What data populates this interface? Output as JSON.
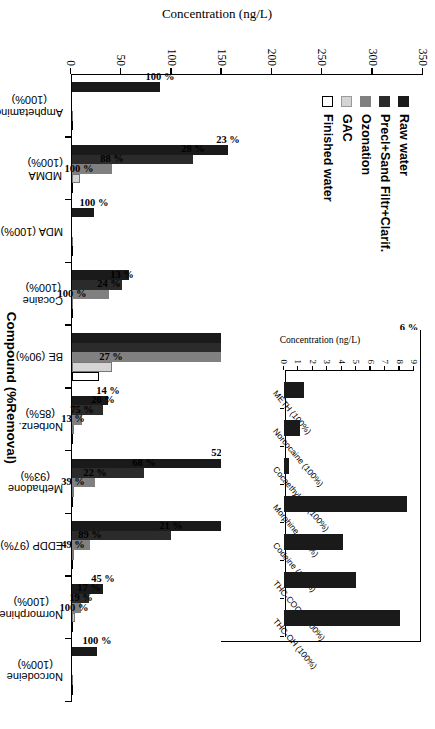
{
  "chart_data": [
    {
      "id": "main",
      "type": "bar",
      "orientation": "vertical-grouped",
      "title": "",
      "xlabel": "Compound (%Removal)",
      "ylabel": "Concentration (ng/L)",
      "ylim": [
        0,
        350
      ],
      "yticks": [
        0,
        50,
        100,
        150,
        200,
        250,
        300,
        350
      ],
      "grid": false,
      "legend_position": "upper-left",
      "series": [
        {
          "name": "Raw water",
          "color": "#1a1a1a",
          "values": [
            88,
            155,
            22,
            57,
            335,
            36,
            150,
            163,
            31,
            25
          ]
        },
        {
          "name": "Precl+Sand Filtr+Clarif.",
          "color": "#2b2b2b",
          "values": [
            0,
            120,
            0,
            50,
            300,
            31,
            72,
            98,
            17,
            0
          ]
        },
        {
          "name": "Ozonation",
          "color": "#808080",
          "values": [
            0,
            40,
            0,
            37,
            177,
            10,
            23,
            18,
            9,
            0
          ]
        },
        {
          "name": "GAC",
          "color": "#d4d4d4",
          "values": [
            0,
            8,
            0,
            0,
            40,
            2.5,
            2.5,
            2,
            3,
            0
          ]
        },
        {
          "name": "Finished water",
          "color": "#ffffff",
          "values": [
            0,
            0,
            0,
            0,
            27,
            0,
            0,
            0,
            0,
            0
          ]
        }
      ],
      "categories": [
        {
          "name": "Amphetamine",
          "removal": "(100%)"
        },
        {
          "name": "MDMA",
          "removal": "(100%)"
        },
        {
          "name": "MDA (100%)",
          "removal": ""
        },
        {
          "name": "Cocaine",
          "removal": "(100%)"
        },
        {
          "name": "BE (90%)",
          "removal": ""
        },
        {
          "name": "Norbenz.",
          "removal": "(85%)"
        },
        {
          "name": "Methadone",
          "removal": "(93%)"
        },
        {
          "name": "EDDP (97%)",
          "removal": ""
        },
        {
          "name": "Normorphine",
          "removal": "(100%)"
        },
        {
          "name": "Norcodeine",
          "removal": "(100%)"
        }
      ],
      "annotations": [
        {
          "category": "Amphetamine",
          "labels": [
            {
              "series": "Raw water",
              "text": "100 %"
            }
          ]
        },
        {
          "category": "MDMA",
          "labels": [
            {
              "series": "Raw water",
              "text": "23 %"
            },
            {
              "series": "Precl+Sand Filtr+Clarif.",
              "text": "28 %"
            },
            {
              "series": "Ozonation",
              "text": "88 %"
            },
            {
              "series": "GAC",
              "text": "100 %"
            }
          ]
        },
        {
          "category": "MDA (100%)",
          "labels": [
            {
              "series": "Raw water",
              "text": "100 %"
            }
          ]
        },
        {
          "category": "Cocaine",
          "labels": [
            {
              "series": "Precl+Sand Filtr+Clarif.",
              "text": "13 %"
            },
            {
              "series": "Ozonation",
              "text": "24 %"
            },
            {
              "series": "GAC",
              "text": "100 %"
            }
          ]
        },
        {
          "category": "BE (90%)",
          "labels": [
            {
              "series": "Raw water",
              "text": "6 %"
            },
            {
              "series": "Precl+Sand Filtr+Clarif.",
              "text": "43 %"
            },
            {
              "series": "Ozonation",
              "text": "72 %"
            },
            {
              "series": "GAC",
              "text": "27 %"
            }
          ]
        },
        {
          "category": "Norbenz.",
          "labels": [
            {
              "series": "Raw water",
              "text": "14 %"
            },
            {
              "series": "Precl+Sand Filtr+Clarif.",
              "text": "20 %"
            },
            {
              "series": "Ozonation",
              "text": "75 %"
            },
            {
              "series": "GAC",
              "text": "13 %"
            }
          ]
        },
        {
          "category": "Methadone",
          "labels": [
            {
              "series": "Raw water",
              "text": "52 %"
            },
            {
              "series": "Precl+Sand Filtr+Clarif.",
              "text": "68 %"
            },
            {
              "series": "Ozonation",
              "text": "22 %"
            },
            {
              "series": "GAC",
              "text": "39 %"
            }
          ]
        },
        {
          "category": "EDDP (97%)",
          "labels": [
            {
              "series": "Raw water",
              "text": "40%"
            },
            {
              "series": "Precl+Sand Filtr+Clarif.",
              "text": "21 %"
            },
            {
              "series": "Ozonation",
              "text": "89 %"
            },
            {
              "series": "GAC",
              "text": "49 %"
            }
          ]
        },
        {
          "category": "Normorphine",
          "labels": [
            {
              "series": "Raw water",
              "text": "45 %"
            },
            {
              "series": "Precl+Sand Filtr+Clarif.",
              "text": "17 %"
            },
            {
              "series": "Ozonation",
              "text": "19 %"
            },
            {
              "series": "GAC",
              "text": "100 %"
            }
          ]
        },
        {
          "category": "Norcodeine",
          "labels": [
            {
              "series": "Raw water",
              "text": "100 %"
            }
          ]
        }
      ]
    },
    {
      "id": "inset",
      "type": "bar",
      "title": "",
      "xlabel": "",
      "ylabel": "Concentration (ng/L)",
      "ylim": [
        0,
        9
      ],
      "yticks": [
        0,
        1,
        2,
        3,
        4,
        5,
        6,
        7,
        8,
        9
      ],
      "grid": false,
      "categories": [
        "METH (100%)",
        "Norcocaine (100%)",
        "Cocaethylene (100%)",
        "Morphine (100%)",
        "Codeine (100%)",
        "THC-COOH (100%)",
        "THC-OH (100%)"
      ],
      "values": [
        1.4,
        1.1,
        0.35,
        8.5,
        4.1,
        5.0,
        8.0
      ],
      "series_name": "Raw water",
      "color": "#1a1a1a"
    }
  ]
}
